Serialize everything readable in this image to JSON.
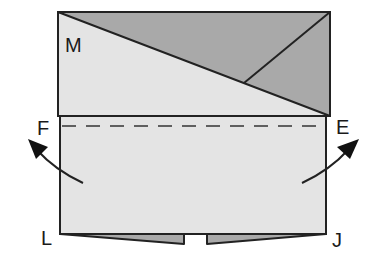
{
  "diagram": {
    "type": "origami-fold-step",
    "labels": {
      "M": "M",
      "F": "F",
      "E": "E",
      "L": "L",
      "J": "J"
    },
    "colors": {
      "light_paper": "#e4e4e4",
      "dark_paper": "#a9a9a9",
      "outline": "#222222",
      "background": "#ffffff"
    },
    "elements": [
      "top flap (folded down) with diagonal crease",
      "lower panel",
      "dashed fold line F–E",
      "curved arrows indicating outward fold",
      "bottom flaps with gap"
    ]
  }
}
